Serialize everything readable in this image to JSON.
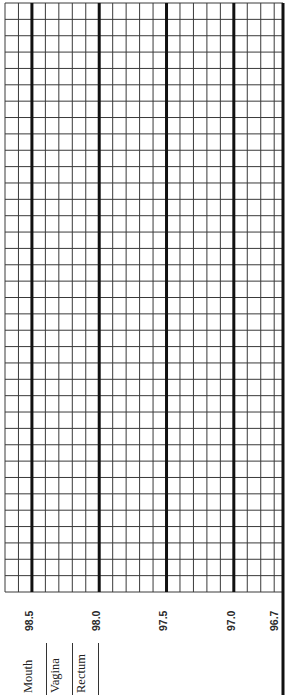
{
  "chart_data": {
    "type": "table",
    "orientation": "rotated -90deg; temperature runs horizontally, days run vertically",
    "xlabel": "Temperature (°F)",
    "ylabel": "",
    "temperature_range": [
      96.7,
      98.7
    ],
    "temperature_step": 0.1,
    "labeled_ticks": [
      "98.5",
      "98.0",
      "97.5",
      "97.0",
      "96.7"
    ],
    "major_gridlines_at": [
      98.5,
      98.0,
      97.5,
      97.0
    ],
    "rows": 36,
    "grid": true,
    "values": []
  },
  "legend": {
    "method_labels": [
      "Mouth",
      "Vagina",
      "Rectum"
    ]
  },
  "colors": {
    "background": "#ffffff",
    "grid_minor": "#3a3a3a",
    "grid_major": "#111111",
    "text": "#222222"
  }
}
